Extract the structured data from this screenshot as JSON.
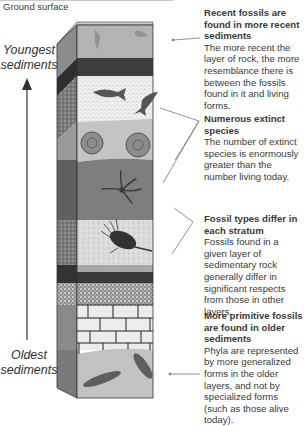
{
  "diagram": {
    "ground_label": "Ground surface",
    "axis": {
      "top_label_line1": "Youngest",
      "top_label_line2": "sediments",
      "bottom_label_line1": "Oldest",
      "bottom_label_line2": "sediments",
      "arrow_direction": "up"
    },
    "layers": [
      {
        "name": "recent-fossil-layer",
        "fill": "#b3b3b3",
        "pattern": "plain",
        "fossils": [
          "shrimp",
          "crustacean"
        ]
      },
      {
        "name": "dark-band-upper",
        "fill": "#3d3d3d",
        "pattern": "plain",
        "fossils": []
      },
      {
        "name": "fish-layer",
        "fill": "#eeeeee",
        "pattern": "fine-stipple",
        "fossils": [
          "fish",
          "fish"
        ]
      },
      {
        "name": "ammonite-layer",
        "fill": "#c4c4c4",
        "pattern": "plain",
        "fossils": [
          "ammonite",
          "ammonite"
        ]
      },
      {
        "name": "starfish-layer",
        "fill": "#7e7e7e",
        "pattern": "plain",
        "fossils": [
          "brittle-star"
        ]
      },
      {
        "name": "trilobite-layer",
        "fill": "#d8d8d8",
        "pattern": "speckle",
        "fossils": [
          "trilobite"
        ]
      },
      {
        "name": "thin-gray-layer",
        "fill": "#a8a8a8",
        "pattern": "plain",
        "fossils": []
      },
      {
        "name": "dark-band-lower",
        "fill": "#3a3a3a",
        "pattern": "plain",
        "fossils": []
      },
      {
        "name": "coarse-sand-layer",
        "fill": "#9a9a9a",
        "pattern": "coarse-speckle",
        "fossils": []
      },
      {
        "name": "brick-layer",
        "fill": "#ececec",
        "pattern": "bricks",
        "fossils": []
      },
      {
        "name": "primitive-fossil-layer",
        "fill": "#c2c2c2",
        "pattern": "plain",
        "fossils": [
          "leaf-shape",
          "leaf-shape"
        ]
      }
    ],
    "annotations": [
      {
        "title": "Recent fossils are found in more recent sediments",
        "body": "The more recent the layer of rock, the more resemblance there is between the fossils found in it and living forms."
      },
      {
        "title": "Numerous extinct species",
        "body": "The number of extinct species is enormously greater than the number living today."
      },
      {
        "title": "Fossil types differ in each stratum",
        "body": "Fossils found in a given layer of sedimentary rock generally differ in significant respects from those in other layers."
      },
      {
        "title": "More primitive fossils are found in older sediments",
        "body": "Phyla are represented by more generalized forms in the older layers, and not by specialized forms (such as those alive today)."
      }
    ],
    "colors": {
      "text": "#3a3a3a",
      "leader_line": "#777777",
      "column_edge": "#333333"
    }
  }
}
